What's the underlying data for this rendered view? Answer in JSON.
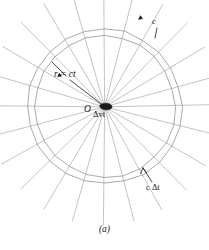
{
  "figure": {
    "caption": "(a)",
    "center_point_label": "O",
    "labels": {
      "radius": "r = ct",
      "speed": "c",
      "thickness": "c Δt",
      "source_displacement": "Δvt"
    },
    "colors": {
      "background": "#ffffff",
      "line": "#8e8e8e",
      "ray": "#9a9a9a",
      "marker": "#1a1a1a",
      "text": "#1a1a1a"
    }
  },
  "chart_data": {
    "type": "scatter",
    "title": "(a)",
    "xlabel": "",
    "ylabel": "",
    "center": {
      "x": 103,
      "y": 108,
      "label": "O"
    },
    "inner_radius": 71,
    "outer_radius": 78,
    "ray_outer_extent": 118,
    "ray_count": 24,
    "ray_angles_deg": [
      0,
      15,
      30,
      45,
      60,
      75,
      90,
      105,
      120,
      135,
      150,
      165,
      180,
      195,
      210,
      225,
      240,
      255,
      270,
      285,
      300,
      315,
      330,
      345
    ],
    "markers": [
      {
        "name": "arrowhead-upper-right",
        "angle_deg": 292,
        "radius": 96,
        "label": "c"
      },
      {
        "name": "arrowhead-upper-left",
        "angle_deg": 215,
        "radius": 55,
        "label": ""
      }
    ],
    "annotations": [
      {
        "text": "r = ct",
        "x": 57,
        "y": 77,
        "leader_to": {
          "x": 103,
          "y": 108
        }
      },
      {
        "text": "c",
        "x": 155,
        "y": 22,
        "leader_to": {
          "x": 148,
          "y": 40
        }
      },
      {
        "text": "c Δt",
        "x": 150,
        "y": 188,
        "leader_to": {
          "x": 146,
          "y": 172
        }
      },
      {
        "text": "Δvt",
        "x": 96,
        "y": 114,
        "leader_to": null
      },
      {
        "text": "O",
        "x": 87,
        "y": 110,
        "leader_to": null
      }
    ],
    "grid": false,
    "legend": "none"
  }
}
